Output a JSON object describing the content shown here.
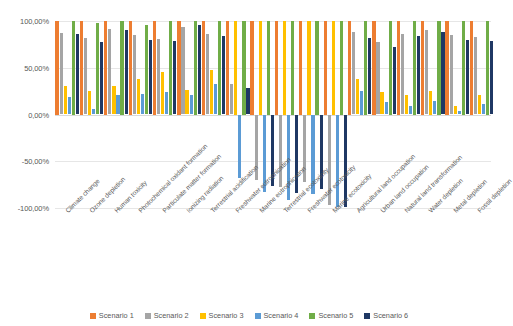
{
  "chart_data": {
    "type": "bar",
    "title": "",
    "xlabel": "",
    "ylabel": "",
    "ylim": [
      -100,
      100
    ],
    "grid": true,
    "legend_position": "bottom",
    "ytick_labels": [
      "100,00%",
      "50,00%",
      "0,00%",
      "-50,00%",
      "-100,00%"
    ],
    "ytick_values": [
      100,
      50,
      0,
      -50,
      -100
    ],
    "categories": [
      "Climate change",
      "Ozone depletion",
      "Human toxicity",
      "Photochemical oxidant formation",
      "Particulate matter formation",
      "Ionizing radiation",
      "Terrestrial acidification",
      "Freshwater eutrophication",
      "Marine eutrophication",
      "Terrestrial ecotoxicity",
      "Freshwater ecotoxicity",
      "Marine ecotoxicity",
      "Agricultural land occupation",
      "Urban land occupation",
      "Natural land transformation",
      "Water depletion",
      "Metal depletion",
      "Fossil depletion"
    ],
    "series": [
      {
        "name": "Scenario 1",
        "color": "#ED7D31",
        "values": [
          100,
          100,
          100,
          100,
          100,
          100,
          100,
          100,
          100,
          100,
          100,
          100,
          100,
          100,
          100,
          100,
          100,
          100
        ]
      },
      {
        "name": "Scenario 2",
        "color": "#A5A5A5",
        "values": [
          87,
          82,
          91,
          85,
          81,
          94,
          86,
          33,
          -70,
          -78,
          -72,
          -97,
          88,
          78,
          86,
          90,
          85,
          83
        ]
      },
      {
        "name": "Scenario 3",
        "color": "#FFC000",
        "values": [
          30,
          25,
          31,
          38,
          45,
          26,
          48,
          100,
          100,
          100,
          100,
          100,
          38,
          24,
          21,
          25,
          9,
          21
        ]
      },
      {
        "name": "Scenario 4",
        "color": "#5B9BD5",
        "values": [
          19,
          6,
          21,
          22,
          24,
          21,
          33,
          -68,
          -83,
          -91,
          -85,
          -99,
          25,
          13,
          9,
          14,
          4,
          11
        ]
      },
      {
        "name": "Scenario 5",
        "color": "#70AD47",
        "values": [
          100,
          98,
          100,
          96,
          100,
          100,
          100,
          100,
          100,
          100,
          100,
          100,
          100,
          100,
          100,
          100,
          100,
          100
        ]
      },
      {
        "name": "Scenario 6",
        "color": "#1F3864",
        "values": [
          86,
          78,
          90,
          80,
          79,
          96,
          84,
          28,
          -76,
          -84,
          -80,
          -99,
          82,
          72,
          84,
          88,
          80,
          79
        ]
      }
    ]
  }
}
